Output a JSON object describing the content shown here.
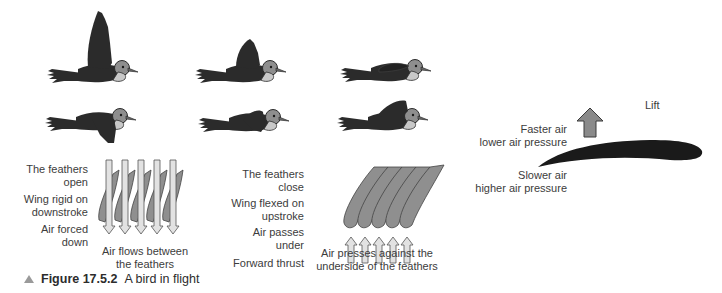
{
  "figure": {
    "number": "Figure 17.5.2",
    "title": "A bird in flight"
  },
  "birds": {
    "top_row": [
      "wings-up-full",
      "wings-up-half",
      "wings-folded"
    ],
    "bottom_row": [
      "wings-down-full",
      "wings-down-half",
      "wings-raising"
    ]
  },
  "downstroke": {
    "labels": [
      {
        "line1": "The feathers",
        "line2": "open"
      },
      {
        "line1": "Wing rigid on",
        "line2": "downstroke"
      },
      {
        "line1": "Air forced",
        "line2": "down"
      }
    ],
    "caption_line1": "Air flows between",
    "caption_line2": "the feathers",
    "arrow_count": 5,
    "arrow_direction": "down"
  },
  "upstroke": {
    "labels": [
      {
        "line1": "The feathers",
        "line2": "close"
      },
      {
        "line1": "Wing flexed on",
        "line2": "upstroke"
      },
      {
        "line1": "Air passes",
        "line2": "under"
      },
      {
        "line1": "Forward thrust",
        "line2": ""
      }
    ],
    "caption_line1": "Air presses against the",
    "caption_line2": "underside of the feathers",
    "arrow_count": 5,
    "arrow_direction": "up"
  },
  "airfoil": {
    "lift_label": "Lift",
    "top_line1": "Faster air",
    "top_line2": "lower air pressure",
    "bottom_line1": "Slower air",
    "bottom_line2": "higher air pressure"
  },
  "colors": {
    "bird_body": "#2b2b2b",
    "bird_head": "#8e8e8e",
    "bird_breast": "#c8c8c8",
    "feather_fill": "#8f8f8f",
    "arrow_fill": "#d8d8d8",
    "lift_arrow": "#8a8a8a",
    "airfoil": "#1a1a1a",
    "caption_triangle": "#9a9a9a"
  }
}
